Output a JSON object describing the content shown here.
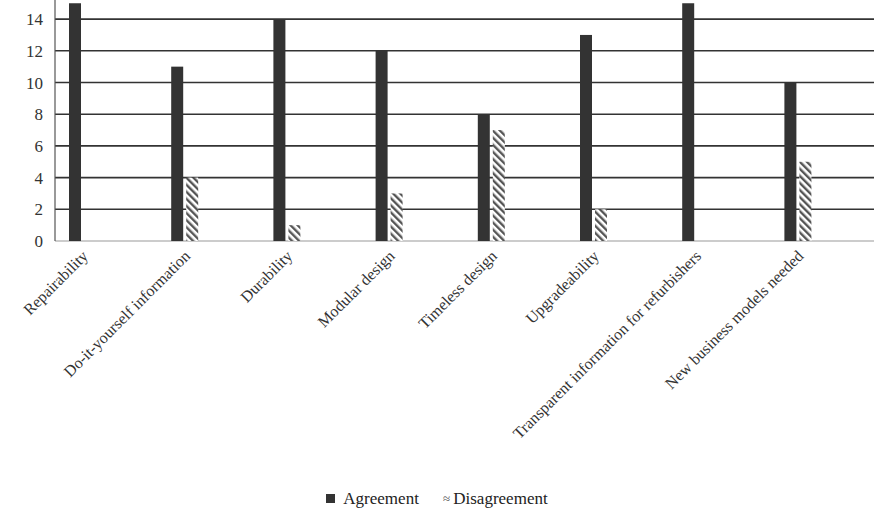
{
  "chart_data": {
    "type": "bar",
    "title": "",
    "xlabel": "",
    "ylabel": "",
    "ylim": [
      0,
      15
    ],
    "yticks": [
      0,
      2,
      4,
      6,
      8,
      10,
      12,
      14
    ],
    "grid": true,
    "legend_position": "bottom",
    "categories": [
      "Repairability",
      "Do-it-yourself information",
      "Durability",
      "Modular design",
      "Timeless design",
      "Upgradeability",
      "Transparent information for refurbishers",
      "New business models needed"
    ],
    "series": [
      {
        "name": "Agreement",
        "values": [
          15,
          11,
          14,
          12,
          8,
          13,
          15,
          10
        ],
        "color": "#333333",
        "pattern": "solid"
      },
      {
        "name": "Disagreement",
        "values": [
          0,
          4,
          1,
          3,
          7,
          2,
          0,
          5
        ],
        "color": "#555555",
        "pattern": "diagonal-hatch"
      }
    ]
  },
  "legend": {
    "agreement_label": "Agreement",
    "disagreement_label": "Disagreement",
    "disagreement_marker": "≈"
  }
}
